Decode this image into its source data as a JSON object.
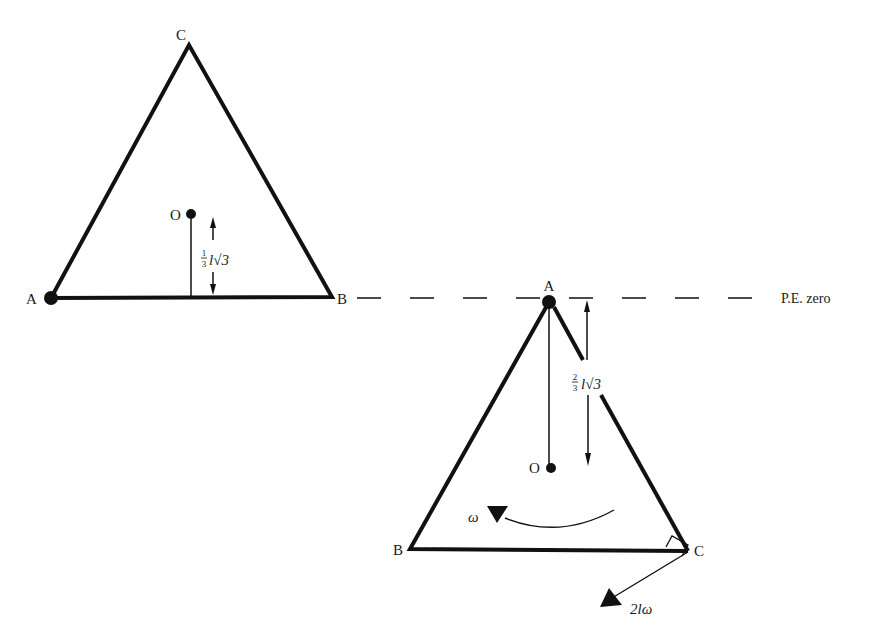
{
  "figure": {
    "left_triangle": {
      "vertices": {
        "A": "A",
        "B": "B",
        "C": "C"
      },
      "centroid_label": "O",
      "height_label": {
        "fraction_num": "1",
        "fraction_den": "3",
        "rest": "l√3"
      }
    },
    "right_triangle": {
      "vertices": {
        "A": "A",
        "B": "B",
        "C": "C"
      },
      "centroid_label": "O",
      "height_label": {
        "fraction_num": "2",
        "fraction_den": "3",
        "rest": "l√3"
      },
      "angular_velocity_label": "ω",
      "velocity_label": "2lω"
    },
    "reference_line_label": "P.E. zero"
  }
}
